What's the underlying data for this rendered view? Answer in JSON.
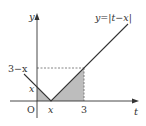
{
  "figure": {
    "function_label": "y=|t−x|",
    "axes": {
      "x_label": "t",
      "y_label": "y",
      "origin_label": "O"
    },
    "x_ticks": [
      {
        "label": "x",
        "italic": true
      },
      {
        "label": "3",
        "italic": false
      }
    ],
    "y_ticks": [
      {
        "label": "3−x",
        "italic": false
      },
      {
        "label": "x",
        "italic": true
      }
    ],
    "colors": {
      "line": "#333333",
      "shade": "#bdbdbd",
      "dashed": "#666666",
      "axis": "#333333"
    },
    "shaded_regions": [
      "triangle from t=0 to t=x under y=|t-x|",
      "triangle from t=x to t=3 under y=|t-x|"
    ]
  }
}
